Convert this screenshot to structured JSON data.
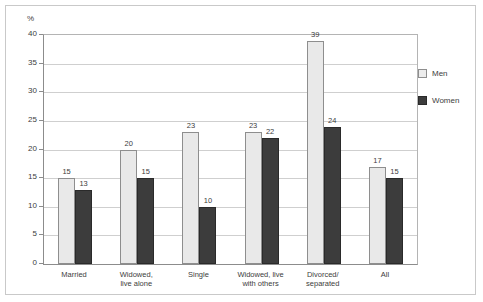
{
  "chart_data": {
    "type": "bar",
    "title": "",
    "subtitle": "",
    "xlabel": "",
    "ylabel": "%",
    "ylim": [
      0,
      40
    ],
    "yticks": [
      0,
      5,
      10,
      15,
      20,
      25,
      30,
      35,
      40
    ],
    "ytick_labels": [
      "0",
      "5",
      "10",
      "15",
      "20",
      "25",
      "30",
      "35",
      "40"
    ],
    "grid": true,
    "legend_position": "right",
    "categories": [
      "Married",
      "Widowed,\nlive alone",
      "Single",
      "Widowed, live\nwith others",
      "Divorced/\nseparated",
      "All"
    ],
    "category_lines": [
      [
        "Married",
        ""
      ],
      [
        "Widowed,",
        "live alone"
      ],
      [
        "Single",
        ""
      ],
      [
        "Widowed, live",
        "with others"
      ],
      [
        "Divorced/",
        "separated"
      ],
      [
        "All",
        ""
      ]
    ],
    "series": [
      {
        "name": "Men",
        "color": "#e9e9e9",
        "values": [
          15,
          20,
          23,
          23,
          39,
          17
        ],
        "labels": [
          "15",
          "20",
          "23",
          "23",
          "39",
          "17"
        ]
      },
      {
        "name": "Women",
        "color": "#3c3c3c",
        "values": [
          13,
          15,
          10,
          22,
          24,
          15
        ],
        "labels": [
          "13",
          "15",
          "10",
          "22",
          "24",
          "15"
        ]
      }
    ]
  },
  "legend": {
    "items": [
      {
        "label": "Men",
        "swatch": "men"
      },
      {
        "label": "Women",
        "swatch": "women"
      }
    ]
  }
}
